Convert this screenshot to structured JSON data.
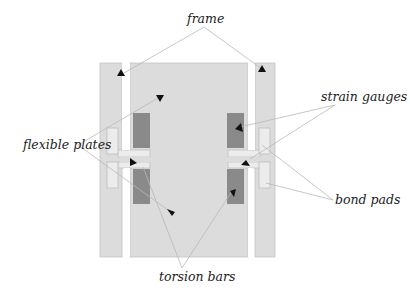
{
  "labels": {
    "frame": "frame",
    "strain_gauges": "strain gauges",
    "flexible_plates": "flexible plates",
    "bond_pads": "bond pads",
    "torsion_bars": "torsion bars"
  },
  "colors": {
    "structure_fill": "#dcdcdc",
    "structure_stroke": "#bdbdbd",
    "gauge_fill": "#8a8a8a",
    "pad_fill": "#ececec",
    "leader_line": "#b9b9b9",
    "arrow": "#111111",
    "text": "#222222"
  }
}
